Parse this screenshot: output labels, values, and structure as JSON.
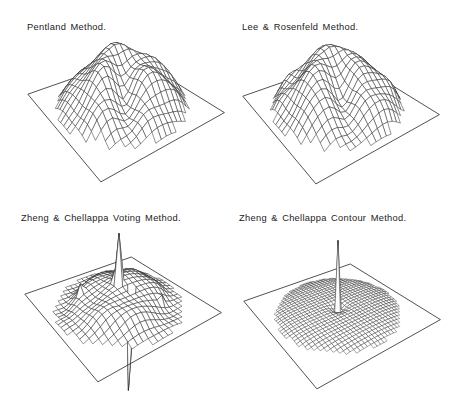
{
  "figure": {
    "width": 463,
    "height": 407,
    "background": "#ffffff",
    "ink": "#262626",
    "mesh_fill": "#ffffff",
    "base_outline_width": 0.8
  },
  "camera": {
    "azimuth_deg": -36,
    "elevation_deg": 36.3,
    "distance": 4.27,
    "focal": 300
  },
  "chart_data": {
    "type": "surface",
    "units": "relative height over a square base plane",
    "panels": [
      {
        "id": "pentland",
        "title": "Pentland Method.",
        "title_pos": {
          "x": 27,
          "y": 23
        },
        "center": {
          "x": 122,
          "y": 103
        },
        "grid": 24,
        "stroke_width": 0.5,
        "shape_summary": "Knobby dome (peak ~0.8 of base half-width) split by a deep crease running from the summit toward the viewer; steep hatched wall on the right lobe.",
        "surface": {
          "preset": "creased-dome",
          "radius": 0.95,
          "height": 0.8,
          "bump": 0.05,
          "seed": 1.3,
          "crease_angle_deg": -30,
          "crease_width": 0.16,
          "crease_depth": 0.62
        }
      },
      {
        "id": "lee-rosenfeld",
        "title": "Lee & Rosenfeld Method.",
        "title_pos": {
          "x": 242,
          "y": 23
        },
        "center": {
          "x": 337,
          "y": 105
        },
        "grid": 24,
        "stroke_width": 0.5,
        "shape_summary": "Very similar knobby dome with a slightly wider crease and larger hatched cliff on the right lobe.",
        "surface": {
          "preset": "creased-dome",
          "radius": 0.95,
          "height": 0.82,
          "bump": 0.05,
          "seed": 4.1,
          "crease_angle_deg": -24,
          "crease_width": 0.18,
          "crease_depth": 0.66
        }
      },
      {
        "id": "zheng-chellappa-voting",
        "title": "Zheng & Chellappa Voting Method.",
        "title_pos": {
          "x": 21,
          "y": 214
        },
        "center": {
          "x": 119,
          "y": 303
        },
        "grid": 24,
        "stroke_width": 0.5,
        "shape_summary": "Low undulating bumpy surface with a tall thin spike up at the center (with a small shoulder step) and a long thin spike down just in front of center piercing the base plane; a few small sharp peaks elsewhere.",
        "surface": {
          "preset": "wavy-spikes",
          "radius": 0.94,
          "mound": 0.3,
          "ring_dip": 0.06,
          "seed": 2.0,
          "spikes": [
            [
              12,
              12,
              1.05
            ],
            [
              11,
              12,
              0.52
            ],
            [
              14,
              13,
              -1.85
            ],
            [
              8,
              7,
              0.3
            ],
            [
              16,
              9,
              0.26
            ],
            [
              7,
              15,
              0.24
            ],
            [
              17,
              17,
              0.2
            ]
          ]
        }
      },
      {
        "id": "zheng-chellappa-contour",
        "title": "Zheng & Chellappa Contour Method.",
        "title_pos": {
          "x": 239,
          "y": 214
        },
        "center": {
          "x": 338,
          "y": 310
        },
        "grid": 36,
        "stroke_width": 0.4,
        "shape_summary": "Nearly flat circular disc of fine mesh lying just above the base plane, with a small funnel dip and a single very tall needle spike at the exact center.",
        "surface": {
          "preset": "disc-spike",
          "radius": 0.9,
          "plateau": 0.06,
          "funnel_depth": 0.1,
          "funnel_width": 0.1,
          "spike": [
            18,
            18,
            1.05
          ]
        }
      }
    ]
  }
}
